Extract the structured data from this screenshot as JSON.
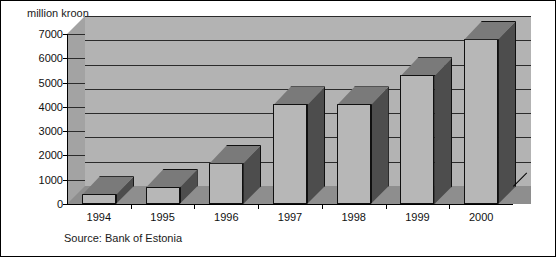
{
  "chart_data": {
    "type": "bar",
    "title": "",
    "subtitle": "",
    "xlabel": "",
    "ylabel": "million kroon",
    "ylim": [
      0,
      7000
    ],
    "yticks": [
      0,
      1000,
      2000,
      3000,
      4000,
      5000,
      6000,
      7000
    ],
    "ytick_labels": [
      "0",
      "1000",
      "2000",
      "3000",
      "4000",
      "5000",
      "6000",
      "7000"
    ],
    "categories": [
      "1994",
      "1995",
      "1996",
      "1997",
      "1998",
      "1999",
      "2000"
    ],
    "values": [
      400,
      700,
      1700,
      4100,
      4100,
      5300,
      6800
    ],
    "series": [
      {
        "name": "million kroon",
        "values": [
          400,
          700,
          1700,
          4100,
          4100,
          5300,
          6800
        ]
      }
    ],
    "grid": true,
    "legend": false,
    "legend_position": "none",
    "style": "3d-columns",
    "annotations": [
      "Source: Bank of Estonia"
    ]
  },
  "figure": {
    "y_unit_caption": "million kroon",
    "source_note": "Source: Bank of Estonia"
  },
  "colors": {
    "bar_front": "#b7b7b7",
    "bar_side": "#4d4d4d",
    "bar_top": "#7a7a7a",
    "back_wall": "#b3b3b3",
    "left_wall": "#a3a3a3",
    "floor": "#8e8e8e",
    "gridline": "#2b2b2b",
    "axis": "#000000",
    "text": "#111111",
    "background": "#ffffff"
  }
}
